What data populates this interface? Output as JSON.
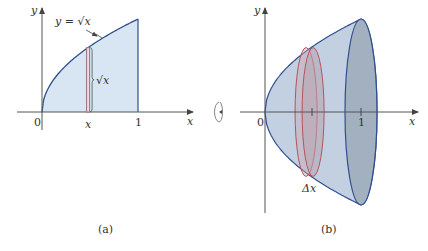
{
  "figure": {
    "colors": {
      "axis": "#555555",
      "region_fill": "#d7e6f2",
      "curve": "#2f4f8f",
      "strip": "#9a6e80",
      "solid_fill": "#b7c8dc",
      "solid_dark": "#9aa7b8",
      "disk": "#b5545c",
      "disk_fill": "#c9a9b3"
    },
    "panel_a": {
      "caption": "(a)",
      "y_axis_label": "y",
      "x_axis_label": "x",
      "origin_label": "0",
      "tick_one_label": "1",
      "strip_x_label": "x",
      "curve_label": "y = √x",
      "height_label": "√x",
      "function": "sqrt",
      "domain": [
        0,
        1
      ],
      "strip_at": 0.48
    },
    "rotation_icon": "rotate-about-x-axis-icon",
    "panel_b": {
      "caption": "(b)",
      "y_axis_label": "y",
      "x_axis_label": "x",
      "origin_label": "0",
      "tick_one_label": "1",
      "disk_label": "Δx",
      "disk_at": 0.48
    }
  }
}
